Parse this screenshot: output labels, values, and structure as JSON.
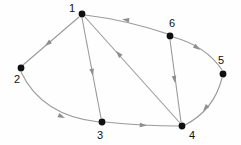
{
  "figure": {
    "kind": "directed-graph",
    "background_color": "#fefefe",
    "width": 241,
    "height": 145
  },
  "style": {
    "node_color": "#101010",
    "node_radius": 3.4,
    "label_color": "#111111",
    "edge_color": "#9a9a9a",
    "arrow_color": "#8e8e8e",
    "edge_width": 1.1
  },
  "nodes": [
    {
      "id": "1",
      "label": "1",
      "x": 82,
      "y": 14,
      "label_x": 72,
      "label_y": 9
    },
    {
      "id": "2",
      "label": "2",
      "x": 21,
      "y": 68,
      "label_x": 17,
      "label_y": 80
    },
    {
      "id": "3",
      "label": "3",
      "x": 102,
      "y": 122,
      "label_x": 100,
      "label_y": 136
    },
    {
      "id": "4",
      "label": "4",
      "x": 182,
      "y": 126,
      "label_x": 192,
      "label_y": 136
    },
    {
      "id": "5",
      "label": "5",
      "x": 223,
      "y": 74,
      "label_x": 221,
      "label_y": 61
    },
    {
      "id": "6",
      "label": "6",
      "x": 170,
      "y": 36,
      "label_x": 172,
      "label_y": 24
    }
  ],
  "edges": [
    {
      "id": "e-6-1",
      "from": "6",
      "to": "1",
      "shape": "curve",
      "path": "M 168 34 Q 126 20 85 15",
      "arrow_x": 122,
      "arrow_y": 19.2,
      "arrow_angle": 188
    },
    {
      "id": "e-4-1",
      "from": "4",
      "to": "1",
      "shape": "line",
      "path": "M 180 123 L 85 17",
      "arrow_x": 116,
      "arrow_y": 51,
      "arrow_angle": 228
    },
    {
      "id": "e-1-2",
      "from": "1",
      "to": "2",
      "shape": "line",
      "path": "M 79 17 L 23 65",
      "arrow_x": 45,
      "arrow_y": 46,
      "arrow_angle": 140
    },
    {
      "id": "e-1-3",
      "from": "1",
      "to": "3",
      "shape": "line",
      "path": "M 82 18 L 101 118",
      "arrow_x": 93,
      "arrow_y": 76,
      "arrow_angle": 79
    },
    {
      "id": "e-2-3",
      "from": "2",
      "to": "3",
      "shape": "curve",
      "path": "M 21 72 Q 42 116 99 122",
      "arrow_x": 65,
      "arrow_y": 118,
      "arrow_angle": 24
    },
    {
      "id": "e-3-4",
      "from": "3",
      "to": "4",
      "shape": "curve",
      "path": "M 105 122 Q 143 126 179 126",
      "arrow_x": 147,
      "arrow_y": 125.6,
      "arrow_angle": 5
    },
    {
      "id": "e-6-4",
      "from": "6",
      "to": "4",
      "shape": "line",
      "path": "M 170 40 L 181 122",
      "arrow_x": 175,
      "arrow_y": 83,
      "arrow_angle": 82
    },
    {
      "id": "e-6-5",
      "from": "6",
      "to": "5",
      "shape": "curve",
      "path": "M 173 37 Q 206 46 222 70",
      "arrow_x": 200,
      "arrow_y": 50,
      "arrow_angle": 37
    },
    {
      "id": "e-5-4",
      "from": "5",
      "to": "4",
      "shape": "curve",
      "path": "M 222 78 Q 214 110 185 125",
      "arrow_x": 203,
      "arrow_y": 111,
      "arrow_angle": 130
    }
  ],
  "chart_data": {
    "type": "diagram",
    "title": "",
    "graph_type": "directed graph",
    "node_count": 6,
    "edge_count": 9,
    "node_labels": [
      "1",
      "2",
      "3",
      "4",
      "5",
      "6"
    ],
    "directed_edges": [
      [
        "6",
        "1"
      ],
      [
        "4",
        "1"
      ],
      [
        "1",
        "2"
      ],
      [
        "1",
        "3"
      ],
      [
        "2",
        "3"
      ],
      [
        "3",
        "4"
      ],
      [
        "6",
        "4"
      ],
      [
        "6",
        "5"
      ],
      [
        "5",
        "4"
      ]
    ],
    "adjacency": {
      "1": [
        "2",
        "3"
      ],
      "2": [
        "3"
      ],
      "3": [
        "4"
      ],
      "4": [
        "1"
      ],
      "5": [
        "4"
      ],
      "6": [
        "1",
        "4",
        "5"
      ]
    },
    "in_degree": {
      "1": 2,
      "2": 1,
      "3": 2,
      "4": 3,
      "5": 1,
      "6": 0
    },
    "out_degree": {
      "1": 2,
      "2": 1,
      "3": 1,
      "4": 1,
      "5": 1,
      "6": 3
    }
  }
}
